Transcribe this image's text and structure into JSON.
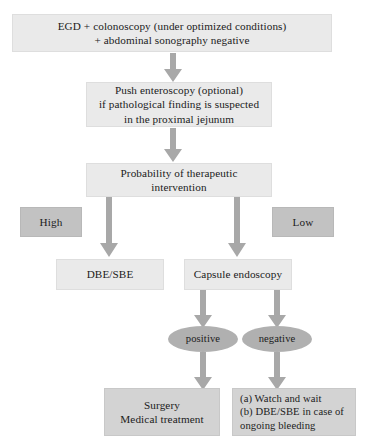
{
  "diagram": {
    "colors": {
      "box_light": "#eaeaea",
      "box_mid": "#d3d3d3",
      "box_dark": "#c2c2c2",
      "ellipse": "#b0b0b0",
      "arrow": "#a8a8a8",
      "text": "#1b1b1b",
      "background": "#ffffff"
    },
    "nodes": {
      "initial_workup": {
        "line1": "EGD + colonoscopy (under optimized conditions)",
        "line2": "+ abdominal sonography negative"
      },
      "push_enteroscopy": {
        "line1": "Push enteroscopy (optional)",
        "line2": "if pathological finding is suspected",
        "line3": "in the proximal jejunum"
      },
      "probability": {
        "line1": "Probability of therapeutic",
        "line2": "intervention"
      },
      "high": {
        "label": "High"
      },
      "low": {
        "label": "Low"
      },
      "dbe_sbe": {
        "label": "DBE/SBE"
      },
      "capsule_endoscopy": {
        "label": "Capsule endoscopy"
      },
      "positive": {
        "label": "positive"
      },
      "negative": {
        "label": "negative"
      },
      "surgery": {
        "line1": "Surgery",
        "line2": "Medical treatment"
      },
      "watch_wait": {
        "line1": "(a) Watch and wait",
        "line2": "(b) DBE/SBE in case of",
        "line3": "ongoing bleeding"
      }
    },
    "edges": [
      {
        "from": "initial_workup",
        "to": "push_enteroscopy",
        "style": "down-arrow"
      },
      {
        "from": "push_enteroscopy",
        "to": "probability",
        "style": "down-arrow"
      },
      {
        "from": "probability",
        "to": "dbe_sbe",
        "style": "down-arrow"
      },
      {
        "from": "probability",
        "to": "capsule_endoscopy",
        "style": "down-arrow"
      },
      {
        "from": "capsule_endoscopy",
        "to": "positive",
        "style": "down-arrow"
      },
      {
        "from": "capsule_endoscopy",
        "to": "negative",
        "style": "down-arrow"
      },
      {
        "from": "positive",
        "to": "surgery",
        "style": "down-arrow"
      },
      {
        "from": "negative",
        "to": "watch_wait",
        "style": "down-arrow"
      }
    ]
  }
}
